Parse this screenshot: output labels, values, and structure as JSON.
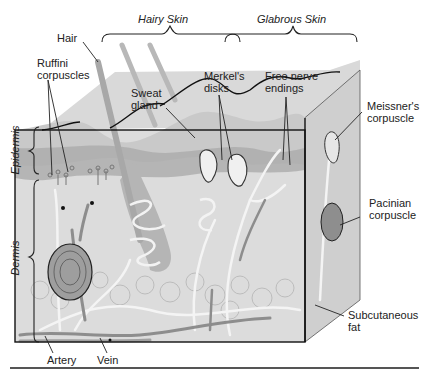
{
  "figure": {
    "type": "anatomical-diagram"
  },
  "region_headings": {
    "hairy_skin": "Hairy Skin",
    "glabrous_skin": "Glabrous Skin"
  },
  "layer_labels": {
    "epidermis": "Epidermis",
    "dermis": "Dermis",
    "subcutaneous_fat_line1": "Subcutaneous",
    "subcutaneous_fat_line2": "fat"
  },
  "structure_labels": {
    "hair": "Hair",
    "ruffini_line1": "Ruffini",
    "ruffini_line2": "corpuscles",
    "sweat_gland_line1": "Sweat",
    "sweat_gland_line2": "gland",
    "merkel_line1": "Merkel's",
    "merkel_line2": "disks",
    "free_nerve_line1": "Free nerve",
    "free_nerve_line2": "endings",
    "meissner_line1": "Meissner's",
    "meissner_line2": "corpuscle",
    "pacinian_line1": "Pacinian",
    "pacinian_line2": "corpuscle",
    "artery": "Artery",
    "vein": "Vein"
  },
  "colors": {
    "epidermis_fill": "#c9c9c9",
    "epidermis_dark": "#a8a8a8",
    "dermis_fill": "#dcdcdc",
    "fat_fill": "#d2d2d2",
    "top_face": "#d9d9d9",
    "side_face": "#cfcfcf",
    "nerve": "#f4f4f4",
    "vessel": "#8d8d8d",
    "outline": "#111111"
  }
}
